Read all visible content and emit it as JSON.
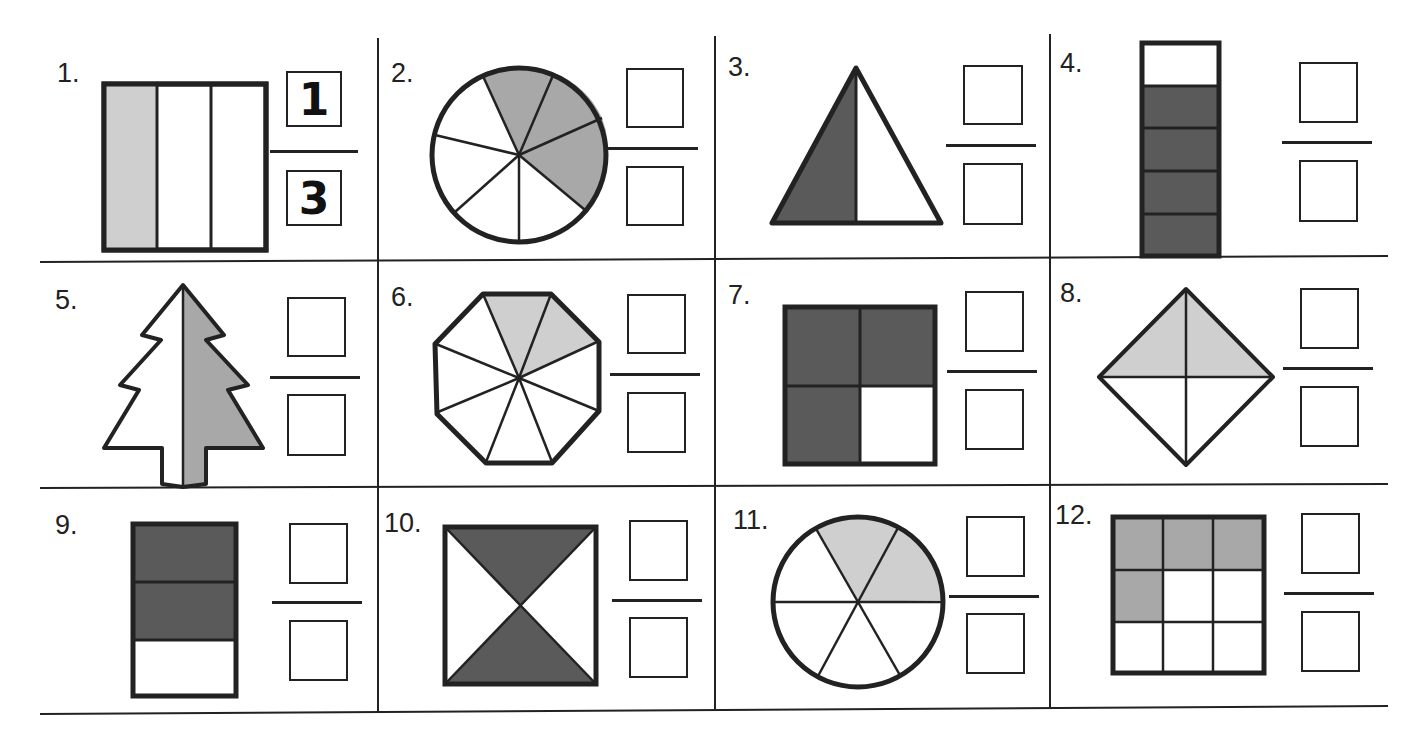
{
  "worksheet": {
    "colors": {
      "line": "#222222",
      "light_shade": "#cfcfcf",
      "medium_shade": "#a8a8a8",
      "dark_shade": "#5a5a5a"
    },
    "problems": [
      {
        "label": "1.",
        "shape": "rectangle-3-vertical-strips",
        "shaded": 1,
        "total": 3,
        "numerator": "1",
        "denominator": "3"
      },
      {
        "label": "2.",
        "shape": "circle-8-slices",
        "shaded": 3,
        "total": 8,
        "numerator": "",
        "denominator": ""
      },
      {
        "label": "3.",
        "shape": "triangle-halves",
        "shaded": 1,
        "total": 2,
        "numerator": "",
        "denominator": ""
      },
      {
        "label": "4.",
        "shape": "tall-rectangle-5-rows",
        "shaded": 4,
        "total": 5,
        "numerator": "",
        "denominator": ""
      },
      {
        "label": "5.",
        "shape": "tree-halves",
        "shaded": 1,
        "total": 2,
        "numerator": "",
        "denominator": ""
      },
      {
        "label": "6.",
        "shape": "octagon-10-slices",
        "shaded": 2,
        "total": 10,
        "numerator": "",
        "denominator": ""
      },
      {
        "label": "7.",
        "shape": "square-quarters",
        "shaded": 3,
        "total": 4,
        "numerator": "",
        "denominator": ""
      },
      {
        "label": "8.",
        "shape": "diamond-quarters",
        "shaded": 2,
        "total": 4,
        "numerator": "",
        "denominator": ""
      },
      {
        "label": "9.",
        "shape": "rectangle-3-rows",
        "shaded": 2,
        "total": 3,
        "numerator": "",
        "denominator": ""
      },
      {
        "label": "10.",
        "shape": "square-4-triangles",
        "shaded": 2,
        "total": 4,
        "numerator": "",
        "denominator": ""
      },
      {
        "label": "11.",
        "shape": "circle-6-slices",
        "shaded": 2,
        "total": 6,
        "numerator": "",
        "denominator": ""
      },
      {
        "label": "12.",
        "shape": "grid-3x3",
        "shaded": 4,
        "total": 9,
        "numerator": "",
        "denominator": ""
      }
    ]
  }
}
